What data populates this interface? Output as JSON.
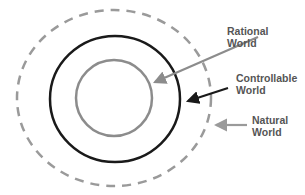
{
  "diagram": {
    "type": "nested-circles",
    "colors": {
      "natural": "#9a9a9a",
      "controllable": "#1a1a1a",
      "rational": "#8c8c8c",
      "label_text": "#555555",
      "background": "#ffffff"
    },
    "layers": [
      {
        "id": "natural",
        "label_line1": "Natural",
        "label_line2": "World",
        "style": "dashed gray ellipse, outermost"
      },
      {
        "id": "controllable",
        "label_line1": "Controllable",
        "label_line2": "World",
        "style": "solid black circle, middle"
      },
      {
        "id": "rational",
        "label_line1": "Rational",
        "label_line2": "World",
        "style": "solid gray circle, innermost"
      }
    ]
  }
}
